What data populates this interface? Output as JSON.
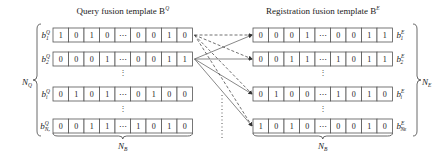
{
  "query": {
    "title": "Query fusion template B",
    "title_sup": "Q",
    "count_label": "N",
    "count_sub": "Q",
    "width_label": "N",
    "width_sub": "B",
    "rows": [
      {
        "label": "b",
        "sup": "Q",
        "sub": "1",
        "bits": [
          "1",
          "0",
          "1",
          "0",
          "⋯",
          "0",
          "0",
          "1",
          "0"
        ]
      },
      {
        "label": "b",
        "sup": "Q",
        "sub": "2",
        "bits": [
          "0",
          "0",
          "0",
          "1",
          "⋯",
          "0",
          "0",
          "1",
          "1"
        ]
      },
      {
        "label": "b",
        "sup": "Q",
        "sub": "i",
        "bits": [
          "0",
          "1",
          "0",
          "1",
          "⋯",
          "0",
          "1",
          "0",
          "0"
        ]
      },
      {
        "label": "b",
        "sup": "Q",
        "sub": "Nᵩ",
        "bits": [
          "0",
          "0",
          "1",
          "1",
          "⋯",
          "1",
          "0",
          "1",
          "0"
        ]
      }
    ]
  },
  "registration": {
    "title": "Registration fusion template B",
    "title_sup": "E",
    "count_label": "N",
    "count_sub": "E",
    "width_label": "N",
    "width_sub": "B",
    "rows": [
      {
        "label": "b",
        "sup": "E",
        "sub": "1",
        "bits": [
          "0",
          "0",
          "0",
          "1",
          "⋯",
          "0",
          "0",
          "1",
          "1"
        ]
      },
      {
        "label": "b",
        "sup": "E",
        "sub": "2",
        "bits": [
          "0",
          "0",
          "1",
          "1",
          "⋯",
          "1",
          "0",
          "1",
          "1"
        ]
      },
      {
        "label": "b",
        "sup": "E",
        "sub": "i",
        "bits": [
          "0",
          "1",
          "0",
          "0",
          "⋯",
          "1",
          "0",
          "1",
          "0"
        ]
      },
      {
        "label": "b",
        "sup": "E",
        "sub": "Nᴇ",
        "bits": [
          "1",
          "0",
          "1",
          "0",
          "⋯",
          "0",
          "0",
          "1",
          "0"
        ]
      }
    ]
  },
  "ellipsis": "⋮",
  "colors": {
    "line": "#333333",
    "box": "#555555"
  }
}
